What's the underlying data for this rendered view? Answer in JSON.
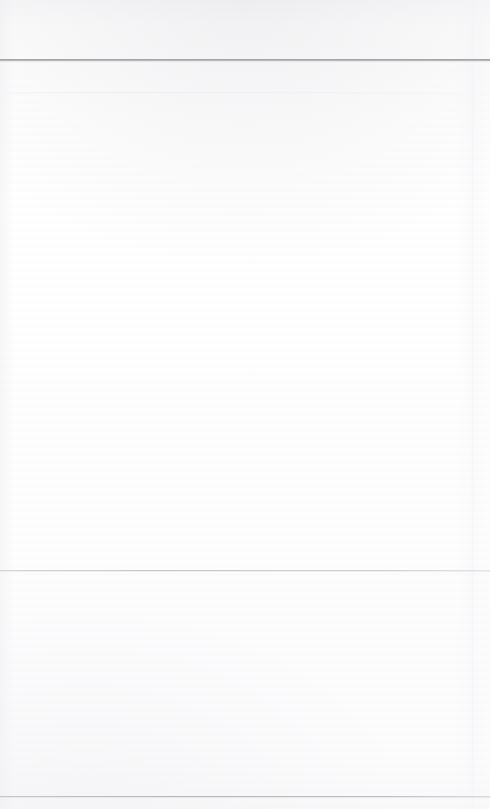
{
  "document": {
    "kind": "scanned-page",
    "title": "",
    "page_number": "",
    "body_text": "",
    "width_px": 490,
    "height_px": 809
  },
  "colors": {
    "paper": "#fdfdfd",
    "paper_top_tint": "#f7f7f8",
    "rule_header": "#98989d",
    "rule_subtle": "#edeef1",
    "rule_body": "#c6c6cc",
    "rule_footer": "#b5b5bb",
    "edge_artifact": "#f3f3f7"
  },
  "regions": {
    "masthead": {
      "label": "",
      "content": ""
    },
    "header": {
      "label": "",
      "content": ""
    },
    "main": {
      "label": "",
      "content": ""
    },
    "lower": {
      "label": "",
      "content": ""
    },
    "footer": {
      "label": "",
      "content": ""
    }
  },
  "rules": [
    {
      "name": "header-rule",
      "y": 59,
      "color": "#98989d"
    },
    {
      "name": "subtle-rule",
      "y": 92,
      "color": "#edeef1"
    },
    {
      "name": "body-divider-rule",
      "y": 570,
      "color": "#c6c6cc"
    },
    {
      "name": "footer-rule",
      "y": 796,
      "color": "#b5b5bb"
    }
  ]
}
